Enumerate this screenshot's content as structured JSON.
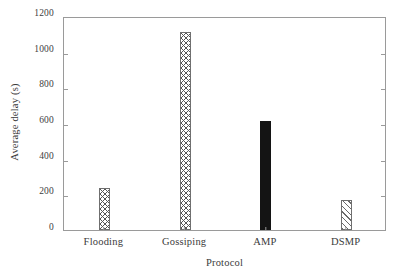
{
  "chart_data": {
    "type": "bar",
    "title": "",
    "xlabel": "Protocol",
    "ylabel": "Average delay (s)",
    "categories": [
      "Flooding",
      "Gossiping",
      "AMP",
      "DSMP"
    ],
    "values": [
      235,
      1110,
      611,
      168
    ],
    "series": [
      {
        "name": "Average delay",
        "values": [
          235,
          1110,
          611,
          168
        ]
      }
    ],
    "bar_styles": [
      "crosshatch",
      "crosshatch",
      "solid",
      "diagonal"
    ],
    "ylim": [
      0,
      1200
    ],
    "yticks": [
      0,
      200,
      400,
      600,
      800,
      1000,
      1200
    ],
    "ytick_labels": [
      "0",
      "200",
      "400",
      "600",
      "800",
      "1000",
      "1200"
    ],
    "grid": false,
    "legend": "none",
    "frame": true,
    "axis_color": "#9a9a9a",
    "bar_fill_color": "#141414",
    "bar_edge_color": "#6f6f6f"
  }
}
